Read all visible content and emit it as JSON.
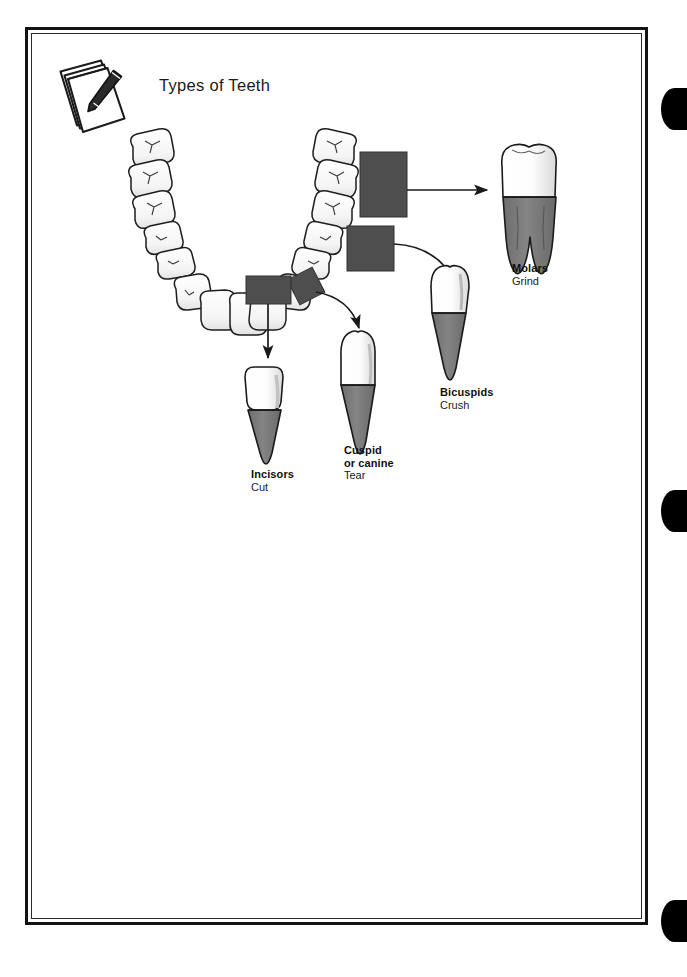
{
  "page": {
    "title": "Types of Teeth",
    "notepad_icon": "notepad-pen-icon",
    "background_color": "#ffffff",
    "frame_color": "#131313",
    "tab_marker_color": "#000000",
    "tab_markers": [
      "edge-tab-1",
      "edge-tab-2",
      "edge-tab-3"
    ]
  },
  "diagram": {
    "name": "types-of-teeth-diagram",
    "arch_label": "lower-dental-arch",
    "highlight_box_color": "#4e4e4e",
    "tooth_crown_color": "#ffffff",
    "tooth_root_color": "#7e7e7e",
    "outline_color": "#1a1a1a",
    "callouts": [
      {
        "id": "molars",
        "name": "Molars",
        "function": "Grind",
        "arrow": "straight-right-arrow",
        "tooth_shape": "two-rooted-molar"
      },
      {
        "id": "bicuspids",
        "name": "Bicuspids",
        "function": "Crush",
        "arrow": "curved-down-right-arrow",
        "tooth_shape": "single-root-premolar"
      },
      {
        "id": "cuspid",
        "name": "Cuspid\nor canine",
        "name_line1": "Cuspid",
        "name_line2": "or canine",
        "function": "Tear",
        "arrow": "curved-down-right-arrow",
        "tooth_shape": "pointed-canine"
      },
      {
        "id": "incisors",
        "name": "Incisors",
        "function": "Cut",
        "arrow": "straight-down-arrow",
        "tooth_shape": "flat-incisor"
      }
    ]
  }
}
